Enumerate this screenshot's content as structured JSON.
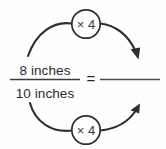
{
  "diagram": {
    "type": "proportion-scaling-diagram",
    "left_fraction": {
      "numerator": "8 inches",
      "denominator": "10 inches"
    },
    "equals_sign": "=",
    "right_fraction": {
      "numerator": "",
      "denominator": ""
    },
    "operations": [
      {
        "position": "top",
        "label": "× 4"
      },
      {
        "position": "bottom",
        "label": "× 4"
      }
    ],
    "colors": {
      "stroke": "#2e2e2e",
      "text": "#2b2b2b",
      "background": "#fefefe"
    }
  }
}
